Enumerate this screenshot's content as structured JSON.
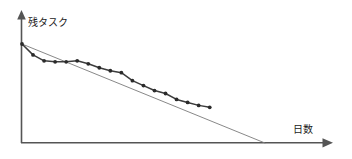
{
  "chart_data": {
    "type": "line",
    "title": "",
    "subtitle": "",
    "xlabel": "日数",
    "ylabel": "残タスク",
    "grid": false,
    "legend": "none",
    "xlim": [
      0,
      24
    ],
    "ylim": [
      0,
      100
    ],
    "x_tick_labels": [],
    "y_tick_labels": [],
    "annotations": [],
    "series": [
      {
        "name": "理想線",
        "style": "straight-thin-gray",
        "color": "#7a7a7a",
        "markers": false,
        "x": [
          0,
          22
        ],
        "values": [
          100,
          0
        ]
      },
      {
        "name": "実績線",
        "style": "polyline-with-dot-markers",
        "color": "#3c3c3c",
        "markers": true,
        "x": [
          0,
          1,
          2,
          3,
          4,
          5,
          6,
          7,
          8,
          9,
          10,
          11,
          12,
          13,
          14,
          15,
          16,
          17
        ],
        "values": [
          100,
          89,
          83,
          82,
          82,
          83,
          80,
          76,
          73,
          71,
          63,
          58,
          53,
          50,
          44,
          41,
          38,
          36
        ]
      }
    ]
  },
  "axes": {
    "y_axis_name": "vertical-axis-with-arrow",
    "x_axis_name": "horizontal-axis-with-arrow",
    "ylabel": "残タスク",
    "xlabel": "日数"
  },
  "colors": {
    "axis": "#555555",
    "ideal_line": "#7a7a7a",
    "actual_line": "#3c3c3c",
    "marker": "#2b2b2b",
    "background": "#ffffff",
    "label_text": "#1a1a1a"
  }
}
